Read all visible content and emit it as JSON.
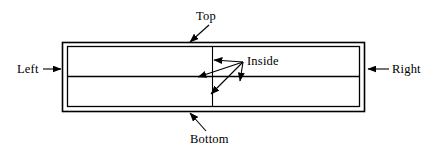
{
  "diagram": {
    "type": "annotated-rectangle-diagram",
    "colors": {
      "background": "#ffffff",
      "stroke": "#000000",
      "text": "#000000"
    },
    "labels": {
      "top": "Top",
      "bottom": "Bottom",
      "left": "Left",
      "right": "Right",
      "inside": "Inside"
    },
    "shape": {
      "outer_rect": {
        "x": 62,
        "y": 42,
        "width": 303,
        "height": 70
      },
      "inner_rect": {
        "x": 67,
        "y": 46,
        "width": 293,
        "height": 61
      },
      "middle_horizontal_line_y": 76,
      "vertical_divider_x": 212
    },
    "annotations": [
      {
        "name": "top",
        "label": "Top",
        "arrow_from": [
          208,
          26
        ],
        "arrow_to": [
          189,
          43
        ],
        "target": "top-border"
      },
      {
        "name": "bottom",
        "label": "Bottom",
        "arrow_from": [
          205,
          131
        ],
        "arrow_to": [
          190,
          113
        ],
        "target": "bottom-border"
      },
      {
        "name": "left",
        "label": "Left",
        "arrow_from": [
          44,
          69
        ],
        "arrow_to": [
          61,
          69
        ],
        "target": "left-border"
      },
      {
        "name": "right",
        "label": "Right",
        "arrow_from": [
          388,
          69
        ],
        "arrow_to": [
          367,
          69
        ],
        "target": "right-border"
      },
      {
        "name": "inside-1",
        "label": "Inside",
        "arrow_from": [
          243,
          62
        ],
        "arrow_to": [
          213,
          60
        ],
        "target": "vertical-divider-upper"
      },
      {
        "name": "inside-2",
        "label": "Inside",
        "arrow_from": [
          243,
          62
        ],
        "arrow_to": [
          198,
          77
        ],
        "target": "middle-horizontal-line"
      },
      {
        "name": "inside-3",
        "label": "Inside",
        "arrow_from": [
          243,
          62
        ],
        "arrow_to": [
          212,
          93
        ],
        "target": "vertical-divider-lower"
      },
      {
        "name": "inside-4",
        "label": "Inside",
        "arrow_from": [
          243,
          62
        ],
        "arrow_to": [
          240,
          80
        ],
        "target": "interior-region"
      }
    ]
  }
}
